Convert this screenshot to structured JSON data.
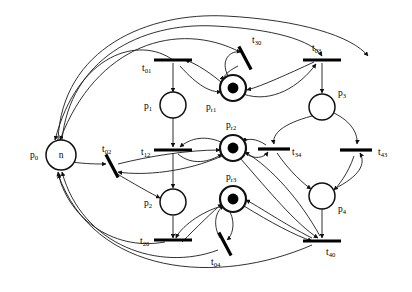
{
  "diagram": {
    "type": "petri-net",
    "background": "#ffffff",
    "stroke_color": "#111111",
    "token_color": "#000000",
    "width": 412,
    "height": 292
  },
  "places": [
    {
      "id": "p0",
      "label": "p",
      "subscript": "0",
      "marking_text": "n",
      "tokens": 0,
      "cx": 61,
      "cy": 155,
      "r": 15,
      "resource": false,
      "label_x": 30,
      "label_y": 158,
      "label_anchor": "start"
    },
    {
      "id": "p1",
      "label": "p",
      "subscript": "1",
      "marking_text": "",
      "tokens": 0,
      "cx": 173,
      "cy": 105,
      "r": 13,
      "resource": false,
      "label_x": 144,
      "label_y": 109,
      "label_anchor": "start"
    },
    {
      "id": "p2",
      "label": "p",
      "subscript": "2",
      "marking_text": "",
      "tokens": 0,
      "cx": 173,
      "cy": 202,
      "r": 13,
      "resource": false,
      "label_x": 144,
      "label_y": 206,
      "label_anchor": "start"
    },
    {
      "id": "p3",
      "label": "p",
      "subscript": "3",
      "marking_text": "",
      "tokens": 0,
      "cx": 322,
      "cy": 107,
      "r": 13,
      "resource": false,
      "label_x": 338,
      "label_y": 96,
      "label_anchor": "start"
    },
    {
      "id": "p4",
      "label": "p",
      "subscript": "4",
      "marking_text": "",
      "tokens": 0,
      "cx": 322,
      "cy": 196,
      "r": 13,
      "resource": false,
      "label_x": 338,
      "label_y": 212,
      "label_anchor": "start"
    },
    {
      "id": "pr1",
      "label": "p",
      "subscript": "r1",
      "marking_text": "",
      "tokens": 1,
      "cx": 233,
      "cy": 88,
      "r": 13,
      "resource": true,
      "label_x": 206,
      "label_y": 110,
      "label_anchor": "start"
    },
    {
      "id": "pr2",
      "label": "p",
      "subscript": "r2",
      "marking_text": "",
      "tokens": 1,
      "cx": 233,
      "cy": 148,
      "r": 13,
      "resource": true,
      "label_x": 226,
      "label_y": 128,
      "label_anchor": "start"
    },
    {
      "id": "pr3",
      "label": "p",
      "subscript": "r3",
      "marking_text": "",
      "tokens": 1,
      "cx": 233,
      "cy": 199,
      "r": 13,
      "resource": true,
      "label_x": 226,
      "label_y": 180,
      "label_anchor": "start"
    }
  ],
  "transitions": [
    {
      "id": "t01",
      "label": "t",
      "subscript": "01",
      "x": 173,
      "y": 60,
      "angle": 0,
      "half": 19,
      "label_x": 142,
      "label_y": 71,
      "label_anchor": "start"
    },
    {
      "id": "t30",
      "label": "t",
      "subscript": "30",
      "x": 245,
      "y": 58,
      "angle": 62,
      "half": 13,
      "label_x": 252,
      "label_y": 43,
      "label_anchor": "start"
    },
    {
      "id": "t03",
      "label": "t",
      "subscript": "03",
      "x": 322,
      "y": 60,
      "angle": 0,
      "half": 19,
      "label_x": 312,
      "label_y": 51,
      "label_anchor": "start"
    },
    {
      "id": "t02",
      "label": "t",
      "subscript": "02",
      "x": 112,
      "y": 166,
      "angle": 62,
      "half": 13,
      "label_x": 102,
      "label_y": 152,
      "label_anchor": "start"
    },
    {
      "id": "t12",
      "label": "t",
      "subscript": "12",
      "x": 173,
      "y": 150,
      "angle": 0,
      "half": 19,
      "label_x": 141,
      "label_y": 155,
      "label_anchor": "start"
    },
    {
      "id": "t34",
      "label": "t",
      "subscript": "34",
      "x": 274,
      "y": 149,
      "angle": 0,
      "half": 16,
      "label_x": 292,
      "label_y": 155,
      "label_anchor": "start"
    },
    {
      "id": "t43",
      "label": "t",
      "subscript": "43",
      "x": 356,
      "y": 150,
      "angle": 0,
      "half": 16,
      "label_x": 378,
      "label_y": 155,
      "label_anchor": "start"
    },
    {
      "id": "t20",
      "label": "t",
      "subscript": "20",
      "x": 173,
      "y": 240,
      "angle": 0,
      "half": 19,
      "label_x": 140,
      "label_y": 244,
      "label_anchor": "start"
    },
    {
      "id": "t04",
      "label": "t",
      "subscript": "04",
      "x": 225,
      "y": 244,
      "angle": 62,
      "half": 13,
      "label_x": 211,
      "label_y": 265,
      "label_anchor": "start"
    },
    {
      "id": "t40",
      "label": "t",
      "subscript": "40",
      "x": 322,
      "y": 241,
      "angle": 0,
      "half": 19,
      "label_x": 326,
      "label_y": 255,
      "label_anchor": "start"
    }
  ],
  "arcs": [
    {
      "from": "p0",
      "to": "t01",
      "shape": "M 62,140 C 70,60 140,22 215,26 C 272,29 312,40 322,56"
    },
    {
      "from": "p0",
      "to": "t03",
      "shape": "M 58,140 C 62,48 148,12 226,16 C 300,20 352,36 368,56"
    },
    {
      "from": "t01",
      "to": "p0",
      "shape": "M 173,60 C 140,36 78,52 55,140"
    },
    {
      "from": "t01",
      "to": "p1",
      "shape": "M 173,63 L 173,92"
    },
    {
      "from": "p1",
      "to": "t12",
      "shape": "M 173,118 L 173,147"
    },
    {
      "from": "pr1",
      "to": "t01",
      "shape": "M 221,82 C 204,68 192,62 185,60"
    },
    {
      "from": "t01",
      "to": "pr1",
      "shape": "M 180,66 C 198,86 210,92 221,92"
    },
    {
      "from": "t30",
      "to": "pr1",
      "shape": "M 238,66 C 226,72 222,78 224,80"
    },
    {
      "from": "pr1",
      "to": "t30",
      "shape": "M 228,76 C 220,60 230,50 241,52"
    },
    {
      "from": "t03",
      "to": "pr1",
      "shape": "M 314,62 C 288,74 262,86 247,90"
    },
    {
      "from": "pr1",
      "to": "t03",
      "shape": "M 243,94 C 272,104 300,86 316,64"
    },
    {
      "from": "t03",
      "to": "p3",
      "shape": "M 322,63 L 322,93"
    },
    {
      "from": "p3",
      "to": "t34",
      "shape": "M 312,116 C 282,124 272,134 274,144"
    },
    {
      "from": "p3",
      "to": "t43",
      "shape": "M 334,113 C 352,122 358,134 357,144"
    },
    {
      "from": "t34",
      "to": "p4",
      "shape": "M 277,153 C 290,172 304,184 311,189"
    },
    {
      "from": "t43",
      "to": "p4",
      "shape": "M 354,156 C 348,174 338,186 334,190"
    },
    {
      "from": "p4",
      "to": "t43",
      "shape": "M 334,189 C 360,176 366,164 360,153"
    },
    {
      "from": "p4",
      "to": "t40",
      "shape": "M 322,209 L 322,238"
    },
    {
      "from": "pr2",
      "to": "t12",
      "shape": "M 221,142 C 202,134 188,140 180,147"
    },
    {
      "from": "t12",
      "to": "pr2",
      "shape": "M 178,154 C 192,166 210,162 222,154"
    },
    {
      "from": "t34",
      "to": "pr2",
      "shape": "M 266,145 C 256,138 246,138 244,142"
    },
    {
      "from": "pr2",
      "to": "t34",
      "shape": "M 245,153 C 254,160 264,158 268,152"
    },
    {
      "from": "t12",
      "to": "p2",
      "shape": "M 173,153 L 173,188"
    },
    {
      "from": "p2",
      "to": "t20",
      "shape": "M 173,216 L 173,238"
    },
    {
      "from": "t20",
      "to": "p0",
      "shape": "M 165,242 C 110,252 66,214 58,172"
    },
    {
      "from": "p0",
      "to": "t02",
      "shape": "M 72,162 C 86,164 98,164 106,164"
    },
    {
      "from": "t02",
      "to": "p2",
      "shape": "M 114,172 C 134,184 152,194 160,198"
    },
    {
      "from": "t02",
      "to": "pr2",
      "shape": "M 118,164 C 150,156 188,150 220,150"
    },
    {
      "from": "pr2",
      "to": "t02",
      "shape": "M 222,156 C 186,172 144,176 118,172"
    },
    {
      "from": "t04",
      "to": "pr3",
      "shape": "M 220,238 C 212,224 216,210 224,206"
    },
    {
      "from": "pr3",
      "to": "t04",
      "shape": "M 230,212 C 236,224 232,236 227,240"
    },
    {
      "from": "t20",
      "to": "pr3",
      "shape": "M 182,242 C 196,228 214,210 222,204"
    },
    {
      "from": "pr3",
      "to": "t20",
      "shape": "M 222,206 C 200,212 180,228 176,238"
    },
    {
      "from": "t40",
      "to": "pr3",
      "shape": "M 312,238 C 284,224 258,206 246,200"
    },
    {
      "from": "pr3",
      "to": "t40",
      "shape": "M 244,206 C 270,222 296,236 312,241"
    },
    {
      "from": "t04",
      "to": "p0",
      "shape": "M 218,250 C 160,272 82,246 62,172"
    },
    {
      "from": "t40",
      "to": "p0",
      "shape": "M 312,245 C 218,286 94,276 58,174"
    },
    {
      "from": "t40",
      "to": "pr2",
      "shape": "M 320,236 C 300,200 272,168 245,152"
    },
    {
      "from": "pr2",
      "to": "t40",
      "shape": "M 240,158 C 268,190 296,224 318,238"
    },
    {
      "from": "t30",
      "to": "p0",
      "shape": "M 240,52 C 178,20 96,44 60,140"
    }
  ]
}
